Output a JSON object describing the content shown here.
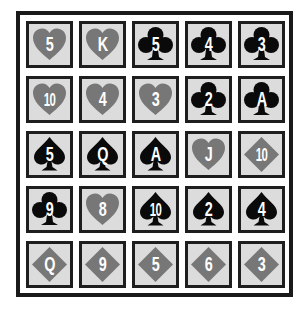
{
  "colors": {
    "cell_fill": "#dcdcdc",
    "cell_border": "#1e1e1e",
    "red_suit": "#777777",
    "black_suit": "#0a0a0a",
    "rank_text": "#ffffff",
    "frame": "#1a1a1a"
  },
  "grid": {
    "rows": 5,
    "cols": 5,
    "cards": [
      [
        {
          "rank": "5",
          "suit": "hearts"
        },
        {
          "rank": "K",
          "suit": "hearts"
        },
        {
          "rank": "5",
          "suit": "clubs"
        },
        {
          "rank": "4",
          "suit": "clubs"
        },
        {
          "rank": "3",
          "suit": "clubs"
        }
      ],
      [
        {
          "rank": "10",
          "suit": "hearts"
        },
        {
          "rank": "4",
          "suit": "hearts"
        },
        {
          "rank": "3",
          "suit": "hearts"
        },
        {
          "rank": "2",
          "suit": "clubs"
        },
        {
          "rank": "A",
          "suit": "clubs"
        }
      ],
      [
        {
          "rank": "5",
          "suit": "spades"
        },
        {
          "rank": "Q",
          "suit": "spades"
        },
        {
          "rank": "A",
          "suit": "spades"
        },
        {
          "rank": "J",
          "suit": "hearts"
        },
        {
          "rank": "10",
          "suit": "diamonds"
        }
      ],
      [
        {
          "rank": "9",
          "suit": "clubs"
        },
        {
          "rank": "8",
          "suit": "hearts"
        },
        {
          "rank": "10",
          "suit": "spades"
        },
        {
          "rank": "2",
          "suit": "spades"
        },
        {
          "rank": "4",
          "suit": "spades"
        }
      ],
      [
        {
          "rank": "Q",
          "suit": "diamonds"
        },
        {
          "rank": "9",
          "suit": "diamonds"
        },
        {
          "rank": "5",
          "suit": "diamonds"
        },
        {
          "rank": "6",
          "suit": "diamonds"
        },
        {
          "rank": "3",
          "suit": "diamonds"
        }
      ]
    ]
  }
}
